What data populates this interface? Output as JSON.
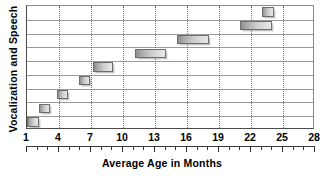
{
  "chart_data": {
    "type": "bar",
    "orientation": "horizontal",
    "bar_style": "range",
    "title": "",
    "xlabel": "Average Age in Months",
    "ylabel": "Vocalization and Speech",
    "xlim": [
      1,
      28
    ],
    "xticks": [
      1,
      4,
      7,
      10,
      13,
      16,
      19,
      22,
      25,
      28
    ],
    "xtick_labels": [
      "1",
      "4",
      "7",
      "10",
      "13",
      "16",
      "19",
      "22",
      "25",
      "28"
    ],
    "minor_tick_interval": 1,
    "grid": {
      "vertical": true,
      "horizontal": true,
      "vertical_style": "dotted",
      "horizontal_style": "solid"
    },
    "legend": "none",
    "categories": [
      "1",
      "2",
      "3",
      "4",
      "5",
      "6",
      "7",
      "8",
      "9"
    ],
    "bars": [
      {
        "row": 1,
        "start": 1.0,
        "end": 2.1,
        "label": ""
      },
      {
        "row": 2,
        "start": 2.1,
        "end": 3.2,
        "label": ""
      },
      {
        "row": 3,
        "start": 3.8,
        "end": 4.8,
        "label": ""
      },
      {
        "row": 4,
        "start": 5.9,
        "end": 6.9,
        "label": ""
      },
      {
        "row": 5,
        "start": 7.2,
        "end": 9.1,
        "label": ""
      },
      {
        "row": 6,
        "start": 11.1,
        "end": 14.0,
        "label": ""
      },
      {
        "row": 7,
        "start": 15.1,
        "end": 18.1,
        "label": ""
      },
      {
        "row": 8,
        "start": 21.0,
        "end": 24.0,
        "label": ""
      },
      {
        "row": 9,
        "start": 23.0,
        "end": 24.2,
        "label": ""
      }
    ],
    "starts": [
      1.0,
      2.1,
      3.8,
      5.9,
      7.2,
      11.1,
      15.1,
      21.0,
      23.0
    ],
    "ends": [
      2.1,
      3.2,
      4.8,
      6.9,
      9.1,
      14.0,
      18.1,
      24.0,
      24.2
    ],
    "values": [
      1.1,
      1.1,
      1.0,
      1.0,
      1.9,
      2.9,
      3.0,
      3.0,
      1.2
    ],
    "colors": {
      "bar_fill_light": "#e9e9e9",
      "bar_fill_dark": "#8d8d8d",
      "bar_border": "#6d6d6d",
      "axis": "#4a4a4a",
      "vertical_grid": "#6f6f6f",
      "horizontal_grid": "#9a9a9a",
      "text": "#000000",
      "background": "#ffffff"
    }
  }
}
